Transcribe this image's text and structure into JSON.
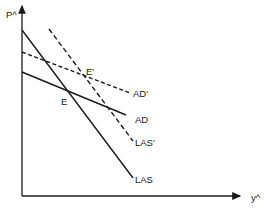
{
  "diagram": {
    "axes": {
      "y_label": "P^",
      "x_label": "y^"
    },
    "curves": [
      {
        "id": "LAS",
        "label": "LAS",
        "style": "solid",
        "x1": 22,
        "y1": 30,
        "x2": 133,
        "y2": 178
      },
      {
        "id": "LAS_prime",
        "label": "LAS'",
        "style": "dashed",
        "x1": 49,
        "y1": 29,
        "x2": 133,
        "y2": 141
      },
      {
        "id": "AD",
        "label": "AD",
        "style": "solid",
        "x1": 22,
        "y1": 72,
        "x2": 126,
        "y2": 115
      },
      {
        "id": "AD_prime",
        "label": "AD'",
        "style": "dashed",
        "x1": 22,
        "y1": 52,
        "x2": 130,
        "y2": 93
      }
    ],
    "points": [
      {
        "id": "E",
        "label": "E"
      },
      {
        "id": "E_prime",
        "label": "E'"
      }
    ],
    "colors": {
      "ink": "#1a1a1a",
      "background": "#ffffff"
    }
  }
}
